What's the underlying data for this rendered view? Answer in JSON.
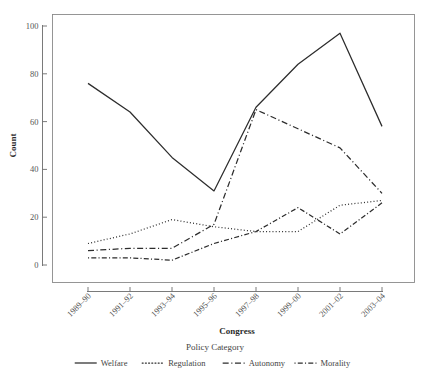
{
  "figure": {
    "background_color": "#ffffff",
    "line_color": "#2d2d2d",
    "axis_color": "#6b6b6b",
    "panel_border_color": "#8a8a8a"
  },
  "axes": {
    "x_title": "Congress",
    "y_title": "Count",
    "y_ticks": [
      "0",
      "20",
      "40",
      "60",
      "80",
      "100"
    ],
    "x_ticks": [
      "1989–90",
      "1991–92",
      "1993–94",
      "1995–96",
      "1997–98",
      "1999–00",
      "2001–02",
      "2003–04"
    ]
  },
  "legend": {
    "title": "Policy Category",
    "entries": [
      {
        "label": "Welfare",
        "dash": "none"
      },
      {
        "label": "Regulation",
        "dash": "dotted"
      },
      {
        "label": "Autonomy",
        "dash": "dashed"
      },
      {
        "label": "Morality",
        "dash": "dash-dot"
      }
    ]
  },
  "chart_data": {
    "type": "line",
    "title": "",
    "subtitle": "",
    "xlabel": "Congress",
    "ylabel": "Count",
    "legend_title": "Policy Category",
    "legend_position": "bottom",
    "grid": false,
    "xlim": [
      0,
      7
    ],
    "ylim": [
      0,
      105
    ],
    "yticks": [
      0,
      20,
      40,
      60,
      80,
      100
    ],
    "categories": [
      "1989–90",
      "1991–92",
      "1993–94",
      "1995–96",
      "1997–98",
      "1999–00",
      "2001–02",
      "2003–04"
    ],
    "series": [
      {
        "name": "Welfare",
        "linestyle": "solid",
        "values": [
          76,
          64,
          45,
          31,
          66,
          84,
          97,
          58
        ]
      },
      {
        "name": "Regulation",
        "linestyle": "dotted",
        "values": [
          9,
          13,
          19,
          16,
          14,
          14,
          25,
          27
        ]
      },
      {
        "name": "Autonomy",
        "linestyle": "dashed",
        "values": [
          6,
          7,
          7,
          17,
          65,
          57,
          49,
          30
        ]
      },
      {
        "name": "Morality",
        "linestyle": "dashdot",
        "values": [
          3,
          3,
          2,
          9,
          14,
          24,
          13,
          26
        ]
      }
    ]
  }
}
